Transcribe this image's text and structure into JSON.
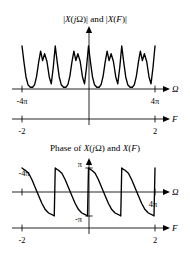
{
  "figure": {
    "width": 190,
    "height": 258,
    "background": "#ffffff",
    "ink_color": "#000000"
  },
  "panels": [
    {
      "id": "magnitude-panel",
      "title": "|X(jΩ)| and |X(F)|",
      "title_x": 95,
      "title_y": 22,
      "omega_axis": {
        "label": "Ω",
        "label_x": 172,
        "label_y": 92,
        "y": 89,
        "x_start": 12,
        "x_end": 163,
        "origin_x": 89,
        "ticks": [
          {
            "value": "-4π",
            "x": 22,
            "label_x": 22,
            "label_y": 104,
            "anchor": "middle"
          },
          {
            "value": "4π",
            "x": 155,
            "label_x": 155,
            "label_y": 104,
            "anchor": "middle"
          }
        ]
      },
      "f_axis": {
        "label": "F",
        "label_x": 172,
        "label_y": 122,
        "y": 119,
        "x_start": 12,
        "x_end": 163,
        "origin_x": 89,
        "ticks": [
          {
            "value": "-2",
            "x": 22,
            "label_x": 22,
            "label_y": 134,
            "anchor": "middle"
          },
          {
            "value": "2",
            "x": 155,
            "label_x": 155,
            "label_y": 134,
            "anchor": "middle"
          }
        ]
      },
      "vaxis": {
        "x": 89,
        "y_top": 26,
        "y_bottom": 125
      }
    },
    {
      "id": "phase-panel",
      "title": "Phase of X(jΩ) and X(F)",
      "title_x": 95,
      "title_y": 151,
      "omega_axis": {
        "label": "Ω",
        "label_x": 172,
        "label_y": 195,
        "y": 192,
        "x_start": 12,
        "x_end": 163,
        "origin_x": 89,
        "ticks": [
          {
            "value": "-4π",
            "x": 22,
            "label_x": 24,
            "label_y": 176,
            "anchor": "middle"
          },
          {
            "value": "4π",
            "x": 155,
            "label_x": 153,
            "label_y": 207,
            "anchor": "middle"
          }
        ]
      },
      "f_axis": {
        "label": "F",
        "label_x": 172,
        "label_y": 231,
        "y": 228,
        "x_start": 12,
        "x_end": 163,
        "origin_x": 89,
        "ticks": [
          {
            "value": "-2",
            "x": 22,
            "label_x": 22,
            "label_y": 243,
            "anchor": "middle"
          },
          {
            "value": "2",
            "x": 155,
            "label_x": 155,
            "label_y": 243,
            "anchor": "middle"
          }
        ]
      },
      "vaxis": {
        "x": 89,
        "y_top": 158,
        "y_bottom": 234
      },
      "y_ticks": [
        {
          "value": "π",
          "y": 168,
          "label_x": 82,
          "label_y": 167,
          "anchor": "end"
        },
        {
          "value": "-π",
          "y": 216,
          "label_x": 82,
          "label_y": 222,
          "anchor": "end"
        }
      ]
    }
  ],
  "chart_data": [
    {
      "type": "line",
      "name": "magnitude-spectrum",
      "title": "|X(jΩ)| and |X(F)|",
      "xlabel": "Ω",
      "xlabel2": "F",
      "ylabel": "|X(jΩ)|",
      "xlim_omega": [
        -4.7124,
        4.7124
      ],
      "xlim_F": [
        -2.3562,
        2.3562
      ],
      "xtick_labels_omega": [
        "-4π",
        "4π"
      ],
      "xtick_labels_F": [
        "-2",
        "2"
      ],
      "grid": false,
      "legend": false,
      "description": "Periodic magnitude spectrum: within each period a pair of narrow peaks rises from a broad U-shaped valley; period repeats 4 times across the plotted range.",
      "period_count": 4,
      "peak_height": 1.0,
      "valley_height": 0.06,
      "comment": "x in normalized period units 0..4 over the axis span x=22..155 px",
      "x": [
        0.0,
        0.06,
        0.12,
        0.18,
        0.25,
        0.32,
        0.38,
        0.44,
        0.5,
        0.56,
        0.62,
        0.68,
        0.75,
        0.82,
        0.88,
        0.94,
        1.0
      ],
      "values": [
        1.0,
        0.62,
        0.28,
        0.1,
        0.04,
        0.04,
        0.1,
        0.3,
        0.62,
        0.88,
        0.66,
        0.82,
        0.64,
        0.28,
        0.12,
        0.5,
        1.0
      ]
    },
    {
      "type": "line",
      "name": "phase-spectrum",
      "title": "Phase of X(jΩ) and X(F)",
      "xlabel": "Ω",
      "xlabel2": "F",
      "ylabel": "Phase",
      "xlim_omega": [
        -4.7124,
        4.7124
      ],
      "xlim_F": [
        -2.3562,
        2.3562
      ],
      "ylim": [
        -3.1416,
        3.1416
      ],
      "ytick_labels": [
        "π",
        "-π"
      ],
      "ytick_values": [
        3.1416,
        -3.1416
      ],
      "xtick_labels_omega": [
        "-4π",
        "4π"
      ],
      "xtick_labels_F": [
        "-2",
        "2"
      ],
      "grid": false,
      "legend": false,
      "description": "Wrapped phase: sawtooth-like, jumps vertically from -π up to +π then decays in an S-shaped curve through zero down to -π; four periods across the range.",
      "period_count": 4,
      "x": [
        0.0,
        0.04,
        0.1,
        0.2,
        0.3,
        0.4,
        0.5,
        0.6,
        0.7,
        0.8,
        0.9,
        0.97,
        1.0
      ],
      "values": [
        3.1416,
        3.0,
        2.85,
        2.45,
        1.6,
        0.55,
        -0.5,
        -1.5,
        -2.3,
        -2.75,
        -2.95,
        -3.1416,
        3.1416
      ]
    }
  ]
}
